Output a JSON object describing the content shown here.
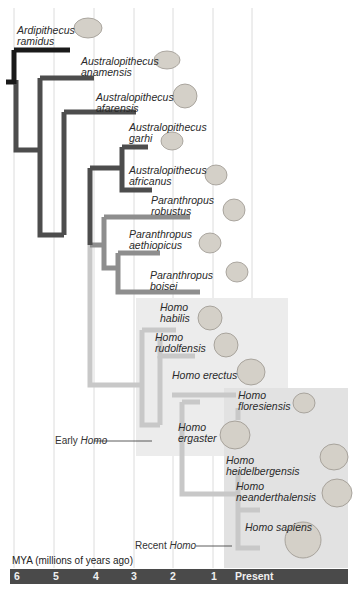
{
  "diagram": {
    "type": "phylogenetic-tree",
    "colors": {
      "early_branch": "#1a1a1a",
      "australopithecus_branch": "#4d4d4d",
      "paranthropus_branch": "#8e8e8e",
      "homo_branch": "#c8c8c8",
      "early_homo_box": "#ececec",
      "recent_homo_box": "#e2e2e2",
      "axis_bar": "#4a4a4a",
      "gridline": "#dcdcdc"
    },
    "species": [
      {
        "genus": "Ardipithecus",
        "species": "ramidus"
      },
      {
        "genus": "Australopithecus",
        "species": "anamensis"
      },
      {
        "genus": "Australopithecus",
        "species": "afarensis"
      },
      {
        "genus": "Australopithecus",
        "species": "garhi"
      },
      {
        "genus": "Australopithecus",
        "species": "africanus"
      },
      {
        "genus": "Paranthropus",
        "species": "robustus"
      },
      {
        "genus": "Paranthropus",
        "species": "aethiopicus"
      },
      {
        "genus": "Paranthropus",
        "species": "boisei"
      },
      {
        "genus": "Homo",
        "species": "habilis"
      },
      {
        "genus": "Homo",
        "species": "rudolfensis"
      },
      {
        "genus": "Homo",
        "species": "erectus",
        "single_line": "Homo erectus"
      },
      {
        "genus": "Homo",
        "species": "floresiensis"
      },
      {
        "genus": "Homo",
        "species": "ergaster"
      },
      {
        "genus": "Homo",
        "species": "heidelbergensis"
      },
      {
        "genus": "Homo",
        "species": "neanderthalensis"
      },
      {
        "genus": "Homo",
        "species": "sapiens",
        "single_line": "Homo sapiens"
      }
    ],
    "groups": {
      "early_homo": {
        "prefix": "Early ",
        "italic": "Homo"
      },
      "recent_homo": {
        "prefix": "Recent ",
        "italic": "Homo"
      }
    },
    "axis": {
      "title": "MYA (millions of years ago)",
      "ticks": [
        "6",
        "5",
        "4",
        "3",
        "2",
        "1",
        "Present"
      ]
    }
  }
}
